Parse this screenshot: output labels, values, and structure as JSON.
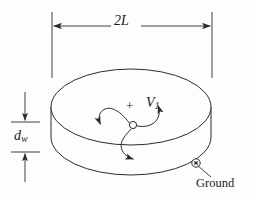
{
  "figure": {
    "background_color": "#fdfdfd",
    "line_color": "#2b2b2b",
    "text_color": "#1a1a1a"
  },
  "labels": {
    "width_dimension": "2L",
    "thickness_dimension_base": "d",
    "thickness_dimension_sub": "w",
    "voltage_base": "V",
    "voltage_sub": "1",
    "polarity_sign": "+",
    "ground_contact": "Ground"
  },
  "geometry": {
    "disk_center_x": 131,
    "disk_top_ellipse_cy": 107,
    "disk_bottom_ellipse_cy": 137,
    "disk_rx": 80,
    "disk_ry": 38,
    "disk_thickness_px": 30,
    "hub_center_x": 133,
    "hub_center_y": 125,
    "hub_radius": 3.6,
    "ground_dot_x": 196,
    "ground_dot_y": 163,
    "ground_dot_radius": 4.2,
    "width_dim_left_x": 52,
    "width_dim_right_x": 212,
    "width_dim_y": 26,
    "thickness_dim_x": 25,
    "thickness_dim_top_y": 122,
    "thickness_dim_bottom_y": 152
  },
  "icons": {
    "left_arrow": "left-arrowhead-icon",
    "right_arrow": "right-arrowhead-icon",
    "down_arrow": "down-arrowhead-icon",
    "up_arrow": "up-arrowhead-icon",
    "swirl": "three-arm-spiral-icon",
    "leader": "leader-line-icon"
  }
}
